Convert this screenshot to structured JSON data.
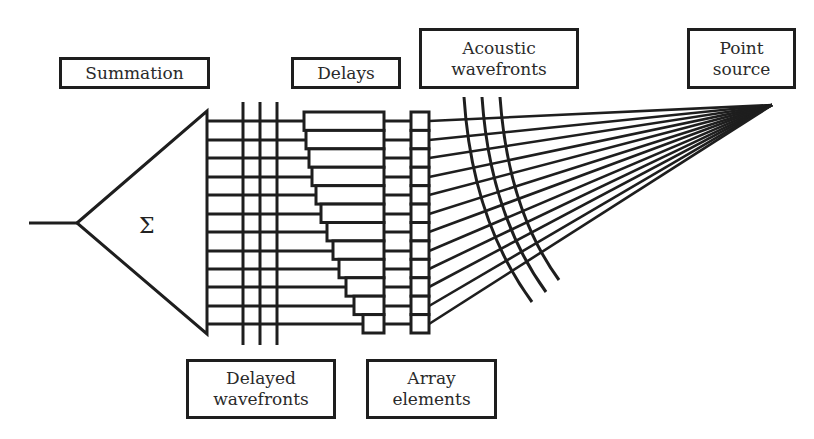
{
  "labels": {
    "summation": "Summation",
    "delays": "Delays",
    "acoustic_wavefronts": "Acoustic\nwavefronts",
    "point_source": "Point\nsource",
    "delayed_wavefronts": "Delayed\nwavefronts",
    "array_elements": "Array\nelements"
  },
  "summation_symbol": "Σ",
  "geometry": {
    "channel_count": 12,
    "channel_y": [
      121,
      140,
      158,
      177,
      195,
      214,
      232,
      251,
      269,
      287,
      306,
      324
    ],
    "point_source": [
      772,
      105
    ],
    "delayed_wavefront_x": [
      243,
      260,
      277
    ],
    "delay_left_edges": [
      304,
      306,
      309,
      312,
      316,
      321,
      327,
      333,
      339,
      346,
      354,
      363
    ],
    "stroke_color": "#1e1e1e"
  }
}
